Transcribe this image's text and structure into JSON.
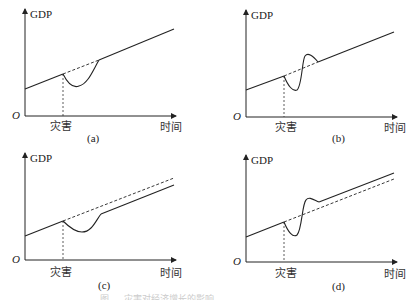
{
  "figure": {
    "panels": [
      {
        "id": "a",
        "label": "(a)",
        "y_label": "GDP",
        "x_label": "时间",
        "event_label": "灾害",
        "origin": "O",
        "description": "GDP dips after disaster then recovers back to original trend line"
      },
      {
        "id": "b",
        "label": "(b)",
        "y_label": "GDP",
        "x_label": "时间",
        "event_label": "灾害",
        "origin": "O",
        "description": "GDP dips, overshoots above trend, then returns to original trend line"
      },
      {
        "id": "c",
        "label": "(c)",
        "y_label": "GDP",
        "x_label": "时间",
        "event_label": "灾害",
        "origin": "O",
        "description": "GDP dips, recovers growth rate but remains permanently below original trend (dashed)"
      },
      {
        "id": "d",
        "label": "(d)",
        "y_label": "GDP",
        "x_label": "时间",
        "event_label": "灾害",
        "origin": "O",
        "description": "GDP dips, overshoots, then settles on a higher path above original trend (dashed)"
      }
    ],
    "caption": "图 … 灾害对经济增长的影响"
  }
}
